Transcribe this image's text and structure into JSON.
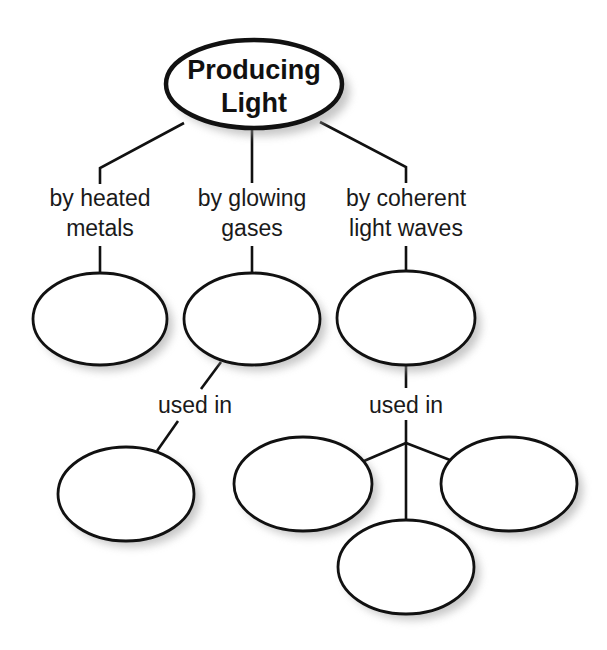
{
  "diagram": {
    "type": "concept-map",
    "root": {
      "label_line1": "Producing",
      "label_line2": "Light"
    },
    "branches": [
      {
        "label_line1": "by heated",
        "label_line2": "metals",
        "answer": ""
      },
      {
        "label_line1": "by glowing",
        "label_line2": "gases",
        "answer": "",
        "link_label": "used in",
        "children": [
          {
            "answer": ""
          }
        ]
      },
      {
        "label_line1": "by coherent",
        "label_line2": "light waves",
        "answer": "",
        "link_label": "used in",
        "children": [
          {
            "answer": ""
          },
          {
            "answer": ""
          },
          {
            "answer": ""
          }
        ]
      }
    ],
    "colors": {
      "stroke": "#111111",
      "fill": "#ffffff",
      "shadow": "#9a9a9a",
      "text": "#1a1a1a"
    }
  }
}
